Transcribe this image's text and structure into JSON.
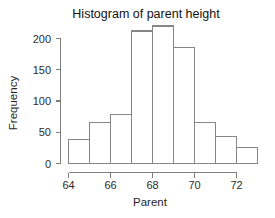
{
  "chart_data": {
    "type": "bar",
    "title": "Histogram of parent height",
    "xlabel": "Parent",
    "ylabel": "Frequency",
    "categories": [
      "64-65",
      "65-66",
      "66-67",
      "67-68",
      "68-69",
      "69-70",
      "70-71",
      "71-72",
      "72-73"
    ],
    "bin_edges": [
      64,
      65,
      66,
      67,
      68,
      69,
      70,
      71,
      72,
      73
    ],
    "values": [
      38,
      66,
      78,
      212,
      220,
      185,
      66,
      43,
      25
    ],
    "xlim": [
      64,
      73
    ],
    "ylim": [
      0,
      220
    ],
    "x_ticks": [
      64,
      66,
      68,
      70,
      72
    ],
    "x_tick_labels": [
      "64",
      "66",
      "68",
      "70",
      "72"
    ],
    "y_ticks": [
      0,
      50,
      100,
      150,
      200
    ],
    "y_tick_labels": [
      "0",
      "50",
      "100",
      "150",
      "200"
    ],
    "grid": false,
    "legend": "none",
    "bar_fill": "#ffffff",
    "bar_stroke": "#868686",
    "axis_color": "#7d7d7d",
    "background": "#ffffff"
  }
}
